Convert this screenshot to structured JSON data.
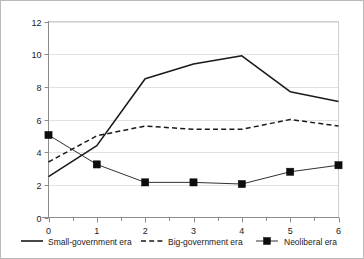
{
  "chart_data": {
    "type": "line",
    "title": "",
    "xlabel": "",
    "ylabel": "",
    "x": [
      0,
      1,
      2,
      3,
      4,
      5,
      6
    ],
    "xticklabels": [
      "0",
      "1",
      "2",
      "3",
      "4",
      "5",
      "6"
    ],
    "yticklabels": [
      "0",
      "2",
      "4",
      "6",
      "8",
      "10",
      "12"
    ],
    "yticks": [
      0,
      2,
      4,
      6,
      8,
      10,
      12
    ],
    "xlim": [
      0,
      6
    ],
    "ylim": [
      0,
      12
    ],
    "grid": "horizontal",
    "legend_position": "bottom",
    "series": [
      {
        "name": "Small-government era",
        "style": "solid",
        "marker": "none",
        "color": "#1a1a1a",
        "values": [
          2.5,
          4.4,
          8.5,
          9.4,
          9.9,
          7.7,
          7.1
        ]
      },
      {
        "name": "Big-government era",
        "style": "dashed",
        "marker": "none",
        "color": "#1a1a1a",
        "values": [
          3.4,
          5.0,
          5.6,
          5.4,
          5.4,
          6.0,
          5.6
        ]
      },
      {
        "name": "Neoliberal era",
        "style": "solid",
        "marker": "square",
        "color": "#1a1a1a",
        "values": [
          5.05,
          3.25,
          2.15,
          2.15,
          2.05,
          2.8,
          3.2
        ]
      }
    ]
  },
  "legend": {
    "items": [
      {
        "label": "Small-government era"
      },
      {
        "label": "Big-government era"
      },
      {
        "label": "Neoliberal era"
      }
    ]
  }
}
